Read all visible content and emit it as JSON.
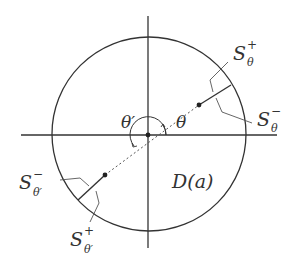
{
  "diagram": {
    "title": "",
    "colors": {
      "stroke": "#333333",
      "background": "#ffffff"
    },
    "labels": {
      "theta": "θ",
      "theta_prime": "θ′",
      "domain": "D(a)",
      "s_theta_plus": {
        "base": "S",
        "sup": "+",
        "sub": "θ"
      },
      "s_theta_minus": {
        "base": "S",
        "sup": "−",
        "sub": "θ"
      },
      "s_theta_prime_minus": {
        "base": "S",
        "sup": "−",
        "sub": "θ′"
      },
      "s_theta_prime_plus": {
        "base": "S",
        "sup": "+",
        "sub": "θ′"
      }
    }
  }
}
